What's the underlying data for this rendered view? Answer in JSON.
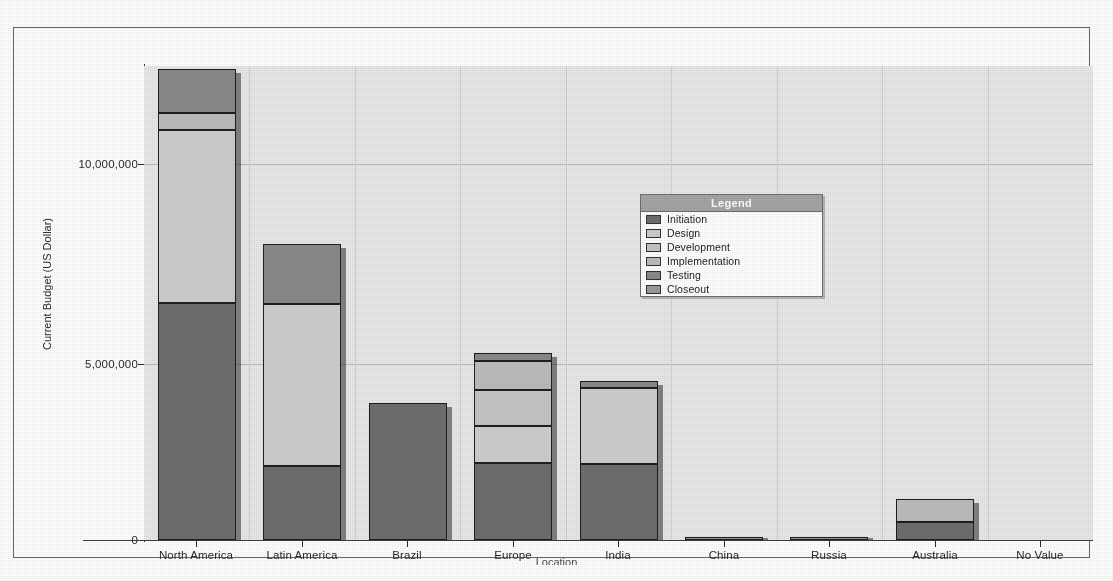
{
  "chart_data": {
    "type": "bar",
    "subtype": "stacked-column",
    "title": "",
    "xlabel": "Location",
    "ylabel": "Current Budget (US Dollar)",
    "ylim": [
      0,
      12600000
    ],
    "y_ticks": [
      0,
      5000000,
      10000000
    ],
    "y_tick_labels": [
      "0",
      "5,000,000",
      "10,000,000"
    ],
    "grid": true,
    "legend_position": "inside-upper-right",
    "legend_title": "Legend",
    "categories": [
      "North America",
      "Latin America",
      "Brazil",
      "Europe",
      "India",
      "China",
      "Russia",
      "Australia",
      "No Value"
    ],
    "series": [
      {
        "name": "Initiation",
        "color": "#6e6e6e",
        "values": [
          6300000,
          1980000,
          3650000,
          2050000,
          2030000,
          0,
          0,
          480000,
          0
        ]
      },
      {
        "name": "Design",
        "color": "#cfcfcf",
        "values": [
          4600000,
          4290000,
          0,
          980000,
          2010000,
          0,
          0,
          0,
          0
        ]
      },
      {
        "name": "Development",
        "color": "#c6c6c6",
        "values": [
          0,
          0,
          0,
          960000,
          0,
          0,
          0,
          0,
          0
        ]
      },
      {
        "name": "Implementation",
        "color": "#bdbdbd",
        "values": [
          450000,
          0,
          0,
          770000,
          0,
          0,
          0,
          620000,
          0
        ]
      },
      {
        "name": "Testing",
        "color": "#8a8a8a",
        "values": [
          1180000,
          1600000,
          0,
          200000,
          175000,
          0,
          0,
          0,
          0
        ]
      },
      {
        "name": "Closeout",
        "color": "#9b9b9b",
        "values": [
          0,
          0,
          0,
          0,
          0,
          40000,
          30000,
          0,
          0
        ]
      }
    ],
    "totals": [
      12530000,
      7870000,
      3650000,
      4960000,
      4215000,
      40000,
      30000,
      1100000,
      0
    ]
  },
  "legend": {
    "title": "Legend",
    "items": [
      {
        "label": "Initiation",
        "color": "#6e6e6e"
      },
      {
        "label": "Design",
        "color": "#cfcfcf"
      },
      {
        "label": "Development",
        "color": "#c6c6c6"
      },
      {
        "label": "Implementation",
        "color": "#bdbdbd"
      },
      {
        "label": "Testing",
        "color": "#8a8a8a"
      },
      {
        "label": "Closeout",
        "color": "#9b9b9b"
      }
    ]
  },
  "axes": {
    "y_title": "Current Budget (US Dollar)",
    "x_title": "Location",
    "y_tick_labels": [
      "10,000,000",
      "5,000,000",
      "0"
    ],
    "x_tick_labels": [
      "North America",
      "Latin America",
      "Brazil",
      "Europe",
      "India",
      "China",
      "Russia",
      "Australia",
      "No Value"
    ]
  },
  "colors": {
    "plot_background": "#e9e9e9",
    "page_background": "#ffffff",
    "gridline": "#b9b9b9",
    "axis": "#3a3a3a",
    "legend_header": "#a5a5a5"
  }
}
